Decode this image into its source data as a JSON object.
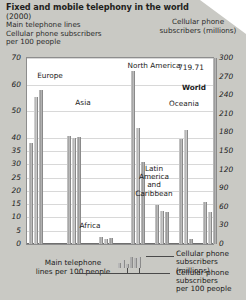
{
  "header": {
    "title": "Fixed and mobile telephony in the world",
    "year": "(2000)",
    "subtitle_left_line1": "Main telephone lines",
    "subtitle_left_line2": "Cellular phone subscribers",
    "subtitle_left_line3": "per 100 people",
    "subtitle_right_line1": "Cellular phone",
    "subtitle_right_line2": "subscribers (millions)"
  },
  "legend": {
    "main_lines_line1": "Main telephone",
    "main_lines_line2": "lines  per 100 people",
    "cell_millions_line1": "Cellular phone",
    "cell_millions_line2": "subscribers (millions)",
    "cell_per100_line1": "Cellular phone",
    "cell_per100_line2": "subscribers",
    "cell_per100_line3": "per 100 people"
  },
  "annotations": {
    "world_value": "719.71",
    "world_label": "World"
  },
  "colors": {
    "page_background": "#c9c9c4",
    "plot_background": "#ffffff",
    "bar_fill": "#a5a5a5",
    "gridline": "#d8d8d8",
    "axis_text": "#1b1b1b"
  },
  "chart_data": {
    "type": "bar",
    "title": "Fixed and mobile telephony in the world",
    "subtitle": "(2000)",
    "xlabel": "",
    "ylabel": "Main telephone lines / Cellular phone subscribers per 100 people",
    "ylabel_right": "Cellular phone subscribers (millions)",
    "ylim": [
      0,
      70
    ],
    "ylim_right": [
      0,
      300
    ],
    "grid": true,
    "legend_position": "bottom",
    "yticks": [
      0,
      5,
      10,
      15,
      20,
      25,
      30,
      35,
      40,
      45,
      50,
      55,
      60,
      65,
      70
    ],
    "ytick_labels": [
      "0",
      "5",
      "10",
      "15",
      "20",
      "25",
      "30",
      "35",
      "40",
      "50",
      "60",
      "70"
    ],
    "yticks_right": [
      0,
      30,
      60,
      90,
      120,
      150,
      180,
      210,
      240,
      270,
      300
    ],
    "ytick_labels_right": [
      "0",
      "30",
      "60",
      "90",
      "120",
      "150",
      "180",
      "210",
      "240",
      "270",
      "300"
    ],
    "categories": [
      "Europe",
      "Asia",
      "Africa",
      "North America",
      "Latin America and Caribbean",
      "Oceania",
      "World"
    ],
    "series": [
      {
        "name": "Main telephone lines per 100 people",
        "unit": "per 100 people",
        "axis": "left",
        "values": [
          38.0,
          40.5,
          2.6,
          65.0,
          14.5,
          39.5,
          16.0
        ]
      },
      {
        "name": "Cellular phone subscribers per 100 people",
        "unit": "per 100 people",
        "axis": "left",
        "values": [
          55.5,
          40.0,
          2.0,
          43.5,
          12.5,
          43.0,
          12.0
        ]
      },
      {
        "name": "Cellular phone subscribers (millions)",
        "unit": "millions",
        "axis": "right",
        "values": [
          249.0,
          172.0,
          10.5,
          133.0,
          51.5,
          8.5,
          719.71
        ]
      }
    ],
    "annotations": [
      {
        "text": "719.71",
        "series": "Cellular phone subscribers (millions)",
        "category": "World"
      }
    ]
  }
}
